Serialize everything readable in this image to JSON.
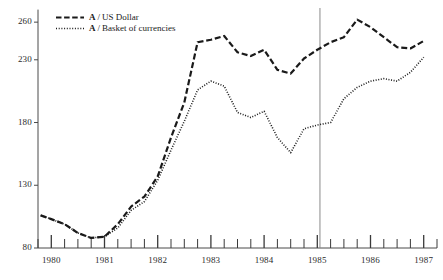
{
  "chart_data": {
    "type": "line",
    "title": "",
    "subtitle": "",
    "xlabel": "",
    "ylabel": "",
    "xlim": [
      1979.75,
      1987.25
    ],
    "ylim": [
      80,
      270
    ],
    "yticks": [
      80,
      130,
      180,
      230,
      260
    ],
    "ytick_labels": [
      "80",
      "130",
      "180",
      "230",
      "260"
    ],
    "xticks": [
      1980,
      1981,
      1982,
      1983,
      1984,
      1985,
      1986,
      1987
    ],
    "xtick_labels": [
      "1980",
      "1981",
      "1982",
      "1983",
      "1984",
      "1985",
      "1986",
      "1987"
    ],
    "minor_xtick_interval": 0.25,
    "grid": false,
    "legend_position": "top-left",
    "annotations": [
      {
        "name": "reference-line-1985",
        "type": "vertical-line",
        "x": 1985.05,
        "label": ""
      }
    ],
    "x": [
      1979.8,
      1980.0,
      1980.25,
      1980.5,
      1980.75,
      1981.0,
      1981.25,
      1981.5,
      1981.75,
      1982.0,
      1982.25,
      1982.5,
      1982.75,
      1983.0,
      1983.25,
      1983.5,
      1983.75,
      1984.0,
      1984.25,
      1984.5,
      1984.75,
      1985.0,
      1985.25,
      1985.5,
      1985.75,
      1986.0,
      1986.25,
      1986.5,
      1986.75,
      1987.0
    ],
    "series": [
      {
        "name": "A / US Dollar",
        "code": "A",
        "label": "US Dollar",
        "style": "dashed",
        "color": "#1a1a1a",
        "values": [
          106,
          103,
          99,
          92,
          88,
          89,
          99,
          113,
          121,
          137,
          168,
          196,
          244,
          246,
          249,
          236,
          233,
          238,
          222,
          219,
          231,
          238,
          244,
          248,
          262,
          256,
          248,
          240,
          239,
          245
        ]
      },
      {
        "name": "A / Basket of currencies",
        "code": "A",
        "label": "Basket of currencies",
        "style": "dotted",
        "color": "#1a1a1a",
        "values": [
          106,
          103,
          99,
          92,
          88,
          89,
          96,
          110,
          117,
          134,
          158,
          181,
          206,
          213,
          209,
          188,
          184,
          189,
          168,
          156,
          175,
          178,
          180,
          199,
          208,
          213,
          215,
          213,
          220,
          232
        ]
      }
    ]
  },
  "legend": {
    "separator": "/",
    "entries": [
      {
        "code": "A",
        "label": "US Dollar",
        "marker": "dashed-line-marker"
      },
      {
        "code": "A",
        "label": "Basket of currencies",
        "marker": "dotted-line-marker"
      }
    ]
  }
}
